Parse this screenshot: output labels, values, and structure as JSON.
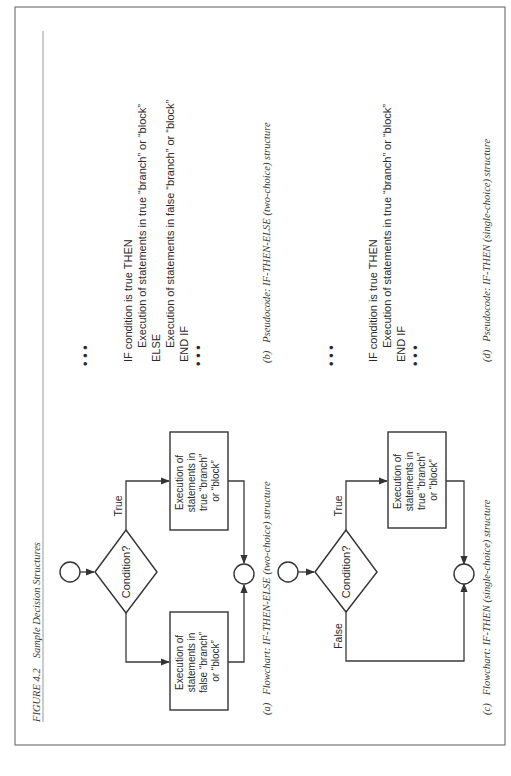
{
  "figure": {
    "number": "FIGURE 4.2",
    "title": "Sample Decision Structures",
    "orientation": "rotated 90° counter-clockwise (text reads bottom-to-top)"
  },
  "panels": {
    "a": {
      "caption_label": "(a)",
      "caption_text": "Flowchart: IF-THEN-ELSE (two-choice) structure",
      "decision": "Condition?",
      "true_label": "True",
      "true_box": [
        "Execution of",
        "statements in",
        "true “branch”",
        "or “block”"
      ],
      "false_box": [
        "Execution of",
        "statements in",
        "false “branch”",
        "or “block”"
      ]
    },
    "b": {
      "caption_label": "(b)",
      "caption_text": "Pseudocode: IF-THEN-ELSE (two-choice) structure",
      "lines": [
        "IF condition is true THEN",
        "Execution of statements in true “branch” or “block”",
        "ELSE",
        "Execution of statements in false “branch” or “block”",
        "END IF"
      ],
      "ellipsis": "•  •  •"
    },
    "c": {
      "caption_label": "(c)",
      "caption_text": "Flowchart: IF-THEN  (single-choice) structure",
      "decision": "Condition?",
      "true_label": "True",
      "false_label": "False",
      "true_box": [
        "Execution of",
        "statements in",
        "true “branch”",
        "or “block”"
      ]
    },
    "d": {
      "caption_label": "(d)",
      "caption_text": "Pseudocode: IF-THEN (single-choice) structure",
      "lines": [
        "IF condition is true THEN",
        "Execution of statements in true “branch” or “block”",
        "END IF"
      ],
      "ellipsis": "•  •  •"
    }
  }
}
